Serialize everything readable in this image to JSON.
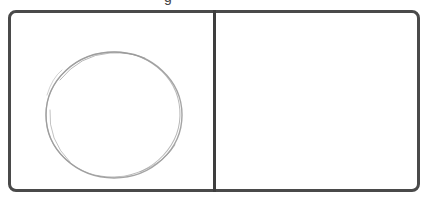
{
  "caption": {
    "visible_fragment": "g"
  },
  "frame": {
    "border_color": "#4a4a4a",
    "panels": [
      {
        "id": "left",
        "content": "hand-drawn circle",
        "shape": {
          "type": "circle",
          "stroke_color": "#9a9a9a"
        }
      },
      {
        "id": "right",
        "content": "empty"
      }
    ]
  },
  "colors": {
    "frame": "#4a4a4a",
    "divider": "#3e3e3e",
    "sketch": "#9a9a9a",
    "background": "#ffffff"
  }
}
